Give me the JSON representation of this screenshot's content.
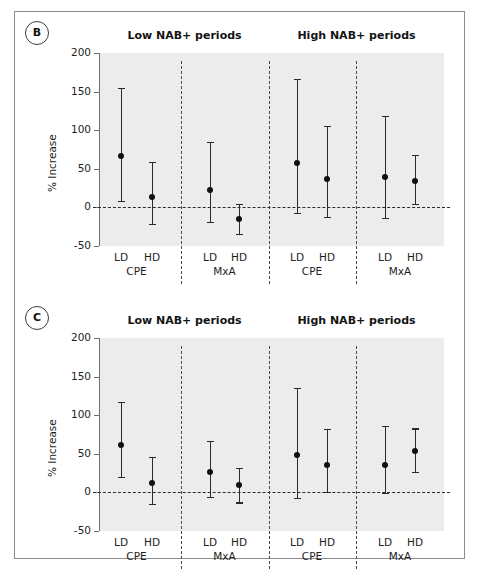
{
  "figure": {
    "panels": [
      {
        "tag": "B",
        "ylabel": "% Increase",
        "group_titles": [
          "Low NAB+ periods",
          "High NAB+ periods"
        ],
        "yticks": [
          200,
          150,
          100,
          50,
          0,
          -50
        ],
        "ylim": [
          -50,
          200
        ],
        "zero_reference": 0,
        "groups": [
          {
            "assay": "CPE",
            "period": "Low NAB+ periods",
            "points": [
              {
                "dose": "LD",
                "value": 66,
                "low": 8,
                "high": 155
              },
              {
                "dose": "HD",
                "value": 13,
                "low": -21,
                "high": 59
              }
            ]
          },
          {
            "assay": "MxA",
            "period": "Low NAB+ periods",
            "points": [
              {
                "dose": "LD",
                "value": 23,
                "low": -19,
                "high": 85
              },
              {
                "dose": "HD",
                "value": -15,
                "low": -34,
                "high": 5
              }
            ]
          },
          {
            "assay": "CPE",
            "period": "High NAB+ periods",
            "points": [
              {
                "dose": "LD",
                "value": 58,
                "low": -7,
                "high": 166
              },
              {
                "dose": "HD",
                "value": 37,
                "low": -12,
                "high": 106
              }
            ]
          },
          {
            "assay": "MxA",
            "period": "High NAB+ periods",
            "points": [
              {
                "dose": "LD",
                "value": 39,
                "low": -14,
                "high": 119
              },
              {
                "dose": "HD",
                "value": 34,
                "low": 5,
                "high": 68
              }
            ]
          }
        ]
      },
      {
        "tag": "C",
        "ylabel": "% Increase",
        "group_titles": [
          "Low NAB+ periods",
          "High NAB+ periods"
        ],
        "yticks": [
          200,
          150,
          100,
          50,
          0,
          -50
        ],
        "ylim": [
          -50,
          200
        ],
        "zero_reference": 0,
        "groups": [
          {
            "assay": "CPE",
            "period": "Low NAB+ periods",
            "points": [
              {
                "dose": "LD",
                "value": 61,
                "low": 20,
                "high": 117
              },
              {
                "dose": "HD",
                "value": 12,
                "low": -15,
                "high": 46
              }
            ]
          },
          {
            "assay": "MxA",
            "period": "Low NAB+ periods",
            "points": [
              {
                "dose": "LD",
                "value": 27,
                "low": -6,
                "high": 67
              },
              {
                "dose": "HD",
                "value": 9,
                "low": -13,
                "high": 32
              }
            ]
          },
          {
            "assay": "CPE",
            "period": "High NAB+ periods",
            "points": [
              {
                "dose": "LD",
                "value": 49,
                "low": -7,
                "high": 135
              },
              {
                "dose": "HD",
                "value": 36,
                "low": 1,
                "high": 82
              }
            ]
          },
          {
            "assay": "MxA",
            "period": "High NAB+ periods",
            "points": [
              {
                "dose": "LD",
                "value": 36,
                "low": -1,
                "high": 86
              },
              {
                "dose": "HD",
                "value": 53,
                "low": 27,
                "high": 83
              }
            ]
          }
        ]
      }
    ]
  },
  "chart_data": [
    {
      "type": "scatter",
      "panel": "B",
      "title": "",
      "xlabel": "",
      "ylabel": "% Increase",
      "ylim": [
        -50,
        200
      ],
      "yticks": [
        -50,
        0,
        50,
        100,
        150,
        200
      ],
      "grid": false,
      "legend": "none",
      "annotations": [
        "Low NAB+ periods",
        "High NAB+ periods"
      ],
      "categories": [
        "Low/CPE/LD",
        "Low/CPE/HD",
        "Low/MxA/LD",
        "Low/MxA/HD",
        "High/CPE/LD",
        "High/CPE/HD",
        "High/MxA/LD",
        "High/MxA/HD"
      ],
      "values": [
        66,
        13,
        23,
        -15,
        58,
        37,
        39,
        34
      ],
      "ci_low": [
        8,
        -21,
        -19,
        -34,
        -7,
        -12,
        -14,
        5
      ],
      "ci_high": [
        155,
        59,
        85,
        5,
        166,
        106,
        119,
        68
      ]
    },
    {
      "type": "scatter",
      "panel": "C",
      "title": "",
      "xlabel": "",
      "ylabel": "% Increase",
      "ylim": [
        -50,
        200
      ],
      "yticks": [
        -50,
        0,
        50,
        100,
        150,
        200
      ],
      "grid": false,
      "legend": "none",
      "annotations": [
        "Low NAB+ periods",
        "High NAB+ periods"
      ],
      "categories": [
        "Low/CPE/LD",
        "Low/CPE/HD",
        "Low/MxA/LD",
        "Low/MxA/HD",
        "High/CPE/LD",
        "High/CPE/HD",
        "High/MxA/LD",
        "High/MxA/HD"
      ],
      "values": [
        61,
        12,
        27,
        9,
        49,
        36,
        36,
        53
      ],
      "ci_low": [
        20,
        -15,
        -6,
        -13,
        -7,
        1,
        -1,
        27
      ],
      "ci_high": [
        117,
        46,
        67,
        32,
        135,
        82,
        86,
        83
      ]
    }
  ]
}
